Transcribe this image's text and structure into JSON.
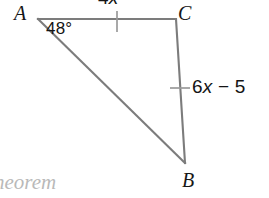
{
  "figure": {
    "kind": "triangle-geometry-diagram",
    "background_color": "#ffffff",
    "stroke_color": "#7c7c7c",
    "tick_color": "#9a9a9a",
    "label_color": "#171717",
    "caption_color": "#b9b9b9",
    "vertices": {
      "a": {
        "label": "A",
        "x": 38,
        "y": 19
      },
      "c": {
        "label": "C",
        "x": 176,
        "y": 19
      },
      "b": {
        "label": "B",
        "x": 185,
        "y": 163
      }
    },
    "sides": [
      {
        "name": "AC",
        "from": "A",
        "to": "C",
        "measure_prefix": "4",
        "measure_variable": "x",
        "measure_suffix": "",
        "tick_marks": 1,
        "tick_orientation": "vertical"
      },
      {
        "name": "CB",
        "from": "C",
        "to": "B",
        "measure_prefix": "6",
        "measure_variable": "x",
        "measure_suffix": " − 5",
        "tick_marks": 1,
        "tick_orientation": "horizontal"
      },
      {
        "name": "AB",
        "from": "A",
        "to": "B",
        "measure_prefix": "",
        "measure_variable": "",
        "measure_suffix": "",
        "tick_marks": 0,
        "tick_orientation": "none"
      }
    ],
    "angles": [
      {
        "at_vertex": "A",
        "label": "48°"
      }
    ],
    "caption_fragment": "heorem"
  }
}
